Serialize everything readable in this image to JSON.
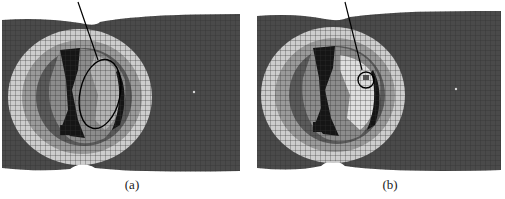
{
  "figure": {
    "panels": [
      {
        "id": "a",
        "caption": "(a)",
        "annotation": "large-ellipse",
        "colors": {
          "background_mesh": "#4a4a4a",
          "light_ring": "#cfcfcf",
          "mid_gray": "#8a8a8a",
          "dark_region": "#151515",
          "light_region": "#b5b5b5",
          "pointer": "#000000"
        }
      },
      {
        "id": "b",
        "caption": "(b)",
        "annotation": "small-circle",
        "colors": {
          "background_mesh": "#4a4a4a",
          "light_ring": "#cfcfcf",
          "mid_gray": "#8a8a8a",
          "dark_region": "#151515",
          "light_region": "#e0e0e0",
          "pointer": "#000000"
        }
      }
    ]
  }
}
